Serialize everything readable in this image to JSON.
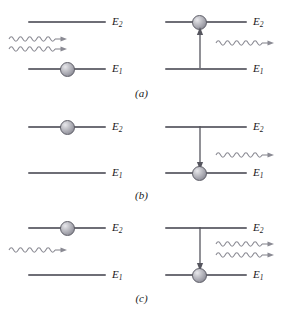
{
  "figure": {
    "width": 283,
    "height": 309,
    "background": "#ffffff",
    "line_color": "#6e6e76",
    "arrow_color": "#55555e",
    "photon_color": "#8a8a93",
    "text_color": "#1a1a1a",
    "sphere_color": "#a2a2ab"
  },
  "labels": {
    "upper_level": "E",
    "upper_level_sub": "2",
    "lower_level": "E",
    "lower_level_sub": "1"
  },
  "panels": [
    {
      "caption": "(a)",
      "process": "absorption",
      "before": {
        "electron_level": "E1",
        "incoming_photons": 2,
        "outgoing_photons": 0,
        "transition_arrow": "none"
      },
      "after": {
        "electron_level": "E2",
        "incoming_photons": 0,
        "outgoing_photons": 1,
        "transition_arrow": "up"
      }
    },
    {
      "caption": "(b)",
      "process": "spontaneous-emission",
      "before": {
        "electron_level": "E2",
        "incoming_photons": 0,
        "outgoing_photons": 0,
        "transition_arrow": "none"
      },
      "after": {
        "electron_level": "E1",
        "incoming_photons": 0,
        "outgoing_photons": 1,
        "transition_arrow": "down"
      }
    },
    {
      "caption": "(c)",
      "process": "stimulated-emission",
      "before": {
        "electron_level": "E2",
        "incoming_photons": 1,
        "outgoing_photons": 0,
        "transition_arrow": "none"
      },
      "after": {
        "electron_level": "E1",
        "incoming_photons": 0,
        "outgoing_photons": 2,
        "transition_arrow": "down"
      }
    }
  ]
}
